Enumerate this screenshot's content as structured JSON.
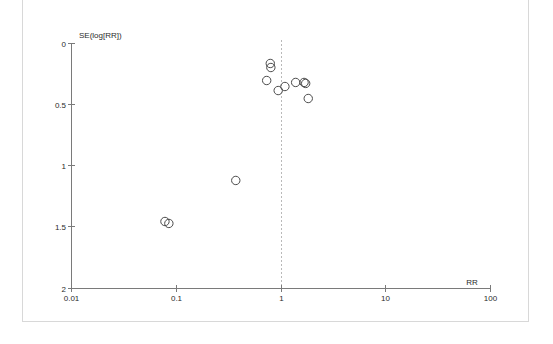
{
  "figure": {
    "kind": "funnel-plot",
    "background_color": "#ffffff",
    "frame_color": "#d8d8d8",
    "axis_color": "#7a7a7a",
    "point_color": "#4a4a4a",
    "reference_line_color": "#b9b9b9"
  },
  "chart_data": {
    "type": "scatter",
    "subtype": "funnel-plot",
    "title": "",
    "xlabel": "RR",
    "ylabel": "SE(log[RR])",
    "xscale": "log",
    "yscale": "linear",
    "y_inverted": true,
    "xlim": [
      0.01,
      100
    ],
    "ylim": [
      0,
      2
    ],
    "grid": false,
    "legend": false,
    "xticks": [
      0.01,
      0.1,
      1,
      10,
      100
    ],
    "xtick_labels": [
      "0.01",
      "0.1",
      "1",
      "10",
      "100"
    ],
    "yticks": [
      0,
      0.5,
      1,
      1.5,
      2
    ],
    "ytick_labels": [
      "0",
      "0.5",
      "1",
      "1.5",
      "2"
    ],
    "reference_line": {
      "orientation": "vertical",
      "x": 1,
      "style": "dashed",
      "label": "no-effect line RR = 1"
    },
    "marker": {
      "shape": "open-circle",
      "radius_px": 4.2,
      "fill": "none",
      "edge": "#4a4a4a"
    },
    "series": [
      {
        "name": "Studies",
        "n_points": 12,
        "points": [
          {
            "rr": 0.79,
            "se": 0.163
          },
          {
            "rr": 0.8,
            "se": 0.196
          },
          {
            "rr": 0.73,
            "se": 0.302
          },
          {
            "rr": 0.94,
            "se": 0.384
          },
          {
            "rr": 1.09,
            "se": 0.351
          },
          {
            "rr": 1.38,
            "se": 0.318
          },
          {
            "rr": 1.66,
            "se": 0.318
          },
          {
            "rr": 1.72,
            "se": 0.326
          },
          {
            "rr": 1.82,
            "se": 0.449
          },
          {
            "rr": 0.37,
            "se": 1.118
          },
          {
            "rr": 0.078,
            "se": 1.453
          },
          {
            "rr": 0.085,
            "se": 1.469
          }
        ]
      }
    ]
  },
  "axes": {
    "x_title": "RR",
    "y_title": "SE(log[RR])"
  }
}
